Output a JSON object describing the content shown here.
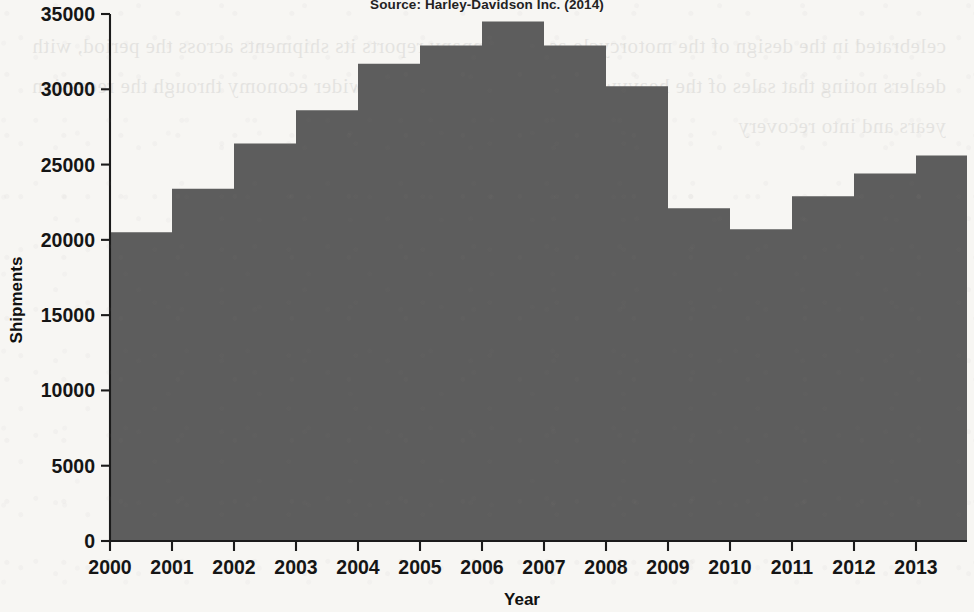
{
  "source_note": "Source: Harley-Davidson Inc. (2014)",
  "axes": {
    "x_title": "Year",
    "y_title": "Shipments",
    "y_ticks": [
      "0",
      "5000",
      "10000",
      "15000",
      "20000",
      "25000",
      "30000",
      "35000"
    ],
    "x_ticks": [
      "2000",
      "2001",
      "2002",
      "2003",
      "2004",
      "2005",
      "2006",
      "2007",
      "2008",
      "2009",
      "2010",
      "2011",
      "2012",
      "2013"
    ]
  },
  "colors": {
    "series_fill": "#5d5d5d",
    "axis": "#1b1b1b",
    "page": "#f7f6f3",
    "text": "#141414"
  },
  "bleed_text": "celebrated in the design of the motorcycle as the company reports its shipments across the period, with dealers noting that sales of the heavyweight models followed the wider economy through the recession years and into recovery",
  "chart_data": {
    "type": "area",
    "subtype": "step-area",
    "title": "",
    "subtitle": "Source: Harley-Davidson Inc. (2014)",
    "xlabel": "Year",
    "ylabel": "Shipments",
    "categories": [
      "2000",
      "2001",
      "2002",
      "2003",
      "2004",
      "2005",
      "2006",
      "2007",
      "2008",
      "2009",
      "2010",
      "2011",
      "2012",
      "2013"
    ],
    "values": [
      20500,
      23400,
      26400,
      28600,
      31700,
      32900,
      34500,
      32900,
      30200,
      22100,
      20700,
      22900,
      24400,
      25600
    ],
    "ylim": [
      0,
      35000
    ],
    "ytick_step": 5000,
    "xlim": [
      "2000",
      "2013"
    ],
    "grid": false,
    "legend": false
  }
}
